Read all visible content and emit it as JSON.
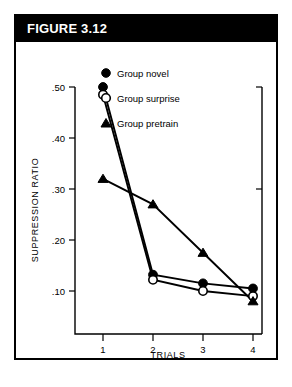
{
  "figure": {
    "title": "FIGURE 3.12"
  },
  "chart_data": {
    "type": "line",
    "title": "FIGURE 3.12",
    "xlabel": "TRIALS",
    "ylabel": "SUPPRESSION RATIO",
    "x": [
      1,
      2,
      3,
      4
    ],
    "categories": [
      "1",
      "2",
      "3",
      "4"
    ],
    "xtick_labels": [
      "1",
      "2",
      "3",
      "4"
    ],
    "ytick_labels": [
      ".50",
      ".40",
      ".30",
      ".20",
      ".10"
    ],
    "ytick_values": [
      0.5,
      0.4,
      0.3,
      0.2,
      0.1
    ],
    "xlim": [
      0.55,
      4.45
    ],
    "ylim": [
      0.0835,
      0.52
    ],
    "grid": false,
    "legend_position": "upper-center",
    "series": [
      {
        "name": "Group novel",
        "marker": "filled-circle",
        "values": [
          0.5,
          0.132,
          0.115,
          0.105
        ]
      },
      {
        "name": "Group surprise",
        "marker": "open-circle",
        "values": [
          0.485,
          0.122,
          0.1,
          0.09
        ]
      },
      {
        "name": "Group pretrain",
        "marker": "filled-triangle",
        "values": [
          0.32,
          0.27,
          0.175,
          0.08
        ]
      }
    ]
  },
  "legend": {
    "items": [
      {
        "label": "Group novel",
        "marker": "filled-circle"
      },
      {
        "label": "Group surprise",
        "marker": "open-circle"
      },
      {
        "label": "Group pretrain",
        "marker": "filled-triangle"
      }
    ]
  }
}
